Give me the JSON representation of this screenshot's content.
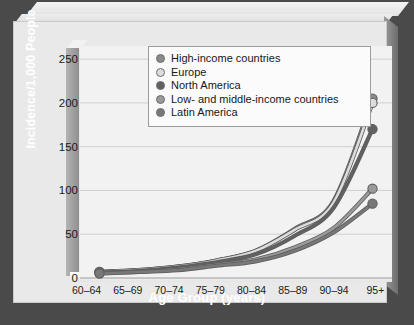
{
  "chart_data": {
    "type": "line",
    "title": "",
    "xlabel": "Age Group (years)",
    "ylabel": "Incidence/1,000 People",
    "categories": [
      "60–64",
      "65–69",
      "70–74",
      "75–79",
      "80–84",
      "85–89",
      "90–94",
      "95+"
    ],
    "yticks": [
      0,
      50,
      100,
      150,
      200,
      250
    ],
    "ylim": [
      0,
      265
    ],
    "grid": true,
    "legend_position": "top-left inside plot",
    "series": [
      {
        "name": "High-income countries",
        "color": "#8a8a8a",
        "values": [
          7,
          9,
          13,
          20,
          31,
          56,
          88,
          205
        ]
      },
      {
        "name": "Europe",
        "color": "#dcdcdc",
        "values": [
          7,
          9,
          13,
          20,
          31,
          55,
          86,
          200
        ]
      },
      {
        "name": "North America",
        "color": "#616161",
        "values": [
          6,
          8,
          12,
          18,
          27,
          48,
          80,
          170
        ]
      },
      {
        "name": "Low- and middle-income countries",
        "color": "#9a9a9a",
        "values": [
          6,
          7,
          10,
          15,
          21,
          35,
          57,
          102
        ]
      },
      {
        "name": "Latin America",
        "color": "#787878",
        "values": [
          5,
          7,
          9,
          14,
          19,
          31,
          52,
          85
        ]
      }
    ]
  },
  "legend": {
    "items": [
      {
        "label": "High-income countries"
      },
      {
        "label": "Europe"
      },
      {
        "label": "North America"
      },
      {
        "label": "Low- and middle-income countries"
      },
      {
        "label": "Latin America"
      }
    ]
  },
  "axes": {
    "y_title": "Incidence/1,000 People",
    "x_title": "Age Group (years)"
  }
}
